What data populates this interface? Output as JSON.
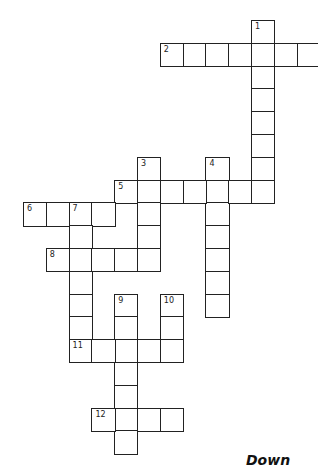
{
  "puzzle": {
    "grid": {
      "origin_x": 23,
      "origin_y": 20,
      "cell_size": 22.8
    },
    "entries": [
      {
        "number": "1",
        "direction": "down",
        "row": 0,
        "col": 10,
        "length": 8
      },
      {
        "number": "2",
        "direction": "across",
        "row": 1,
        "col": 6,
        "length": 7
      },
      {
        "number": "3",
        "direction": "down",
        "row": 6,
        "col": 5,
        "length": 5
      },
      {
        "number": "4",
        "direction": "down",
        "row": 6,
        "col": 8,
        "length": 7
      },
      {
        "number": "5",
        "direction": "across",
        "row": 7,
        "col": 4,
        "length": 7
      },
      {
        "number": "6",
        "direction": "across",
        "row": 8,
        "col": 0,
        "length": 4
      },
      {
        "number": "7",
        "direction": "down",
        "row": 8,
        "col": 2,
        "length": 7
      },
      {
        "number": "8",
        "direction": "across",
        "row": 10,
        "col": 1,
        "length": 5
      },
      {
        "number": "9",
        "direction": "down",
        "row": 12,
        "col": 4,
        "length": 7
      },
      {
        "number": "10",
        "direction": "down",
        "row": 12,
        "col": 6,
        "length": 3
      },
      {
        "number": "11",
        "direction": "across",
        "row": 14,
        "col": 2,
        "length": 5
      },
      {
        "number": "12",
        "direction": "across",
        "row": 17,
        "col": 3,
        "length": 4
      }
    ]
  },
  "clues": {
    "down_heading": "Down"
  }
}
